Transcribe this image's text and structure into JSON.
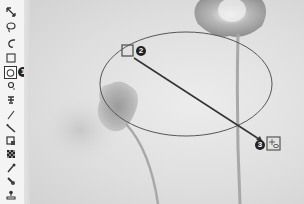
{
  "figure": {
    "accent_color": "#333333"
  },
  "toolbar": {
    "tools": [
      {
        "name": "move-tool",
        "icon": "move-icon",
        "selected": false
      },
      {
        "name": "lasso-tool",
        "icon": "lasso-icon",
        "selected": false
      },
      {
        "name": "quick-selection-tool",
        "icon": "quick-selection-icon",
        "selected": false
      },
      {
        "name": "rectangular-marquee-tool",
        "icon": "rectangle-marquee-icon",
        "selected": false
      },
      {
        "name": "elliptical-marquee-tool",
        "icon": "ellipse-marquee-icon",
        "selected": true
      },
      {
        "name": "spot-healing-tool",
        "icon": "spot-healing-icon",
        "selected": false
      },
      {
        "name": "clone-stamp-tool",
        "icon": "clone-stamp-icon",
        "selected": false
      },
      {
        "name": "line-tool",
        "icon": "line-icon",
        "selected": false
      },
      {
        "name": "pen-tool",
        "icon": "pen-icon",
        "selected": false
      },
      {
        "name": "crop-tool",
        "icon": "crop-icon",
        "selected": false
      },
      {
        "name": "pattern-tool",
        "icon": "pattern-icon",
        "selected": false
      },
      {
        "name": "eyedropper-tool",
        "icon": "eyedropper-icon",
        "selected": false
      },
      {
        "name": "smudge-tool",
        "icon": "smudge-icon",
        "selected": false
      },
      {
        "name": "stamp-tool",
        "icon": "stamp-icon",
        "selected": false
      }
    ]
  },
  "callouts": {
    "c1": "1",
    "c2": "2",
    "c3": "3"
  }
}
